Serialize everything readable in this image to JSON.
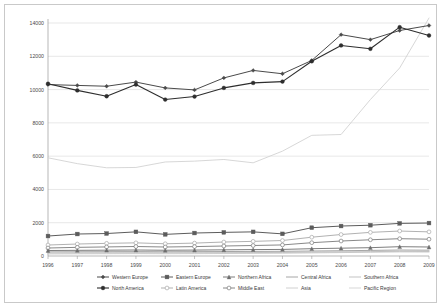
{
  "chart_data": {
    "type": "line",
    "title": "",
    "xlabel": "",
    "ylabel": "",
    "ylim": [
      0,
      14000
    ],
    "yticks": [
      0,
      2000,
      4000,
      6000,
      8000,
      10000,
      12000,
      14000
    ],
    "ytick_labels": [
      "0",
      "2000",
      "4000",
      "6000",
      "8000",
      "10000",
      "12000",
      "14000"
    ],
    "grid": true,
    "legend_position": "bottom",
    "categories": [
      "1996",
      "1997",
      "1998",
      "1999",
      "2000",
      "2001",
      "2002",
      "2003",
      "2004",
      "2005",
      "2006",
      "2007",
      "2008",
      "2009"
    ],
    "series": [
      {
        "name": "Western Europe",
        "color": "#4a4a4a",
        "marker": "diamond",
        "width": 1.0,
        "values": [
          10300,
          10250,
          10200,
          10450,
          10100,
          9980,
          10700,
          11150,
          10950,
          11750,
          13300,
          13000,
          13550,
          13850
        ]
      },
      {
        "name": "Eastern Europe",
        "color": "#5c5c5c",
        "marker": "square",
        "width": 1.0,
        "values": [
          1200,
          1320,
          1350,
          1450,
          1300,
          1380,
          1420,
          1450,
          1330,
          1700,
          1800,
          1850,
          1960,
          1980
        ]
      },
      {
        "name": "Northern Africa",
        "color": "#6e6e6e",
        "marker": "triangle",
        "width": 0.9,
        "values": [
          330,
          340,
          350,
          360,
          345,
          355,
          370,
          385,
          395,
          440,
          470,
          500,
          560,
          540
        ]
      },
      {
        "name": "Central Africa",
        "color": "#8f8f8f",
        "marker": "none",
        "width": 0.8,
        "values": [
          250,
          255,
          260,
          265,
          258,
          262,
          268,
          275,
          282,
          300,
          318,
          335,
          360,
          350
        ]
      },
      {
        "name": "Southern Africa",
        "color": "#b4b4b4",
        "marker": "none",
        "width": 0.8,
        "values": [
          180,
          185,
          190,
          196,
          190,
          194,
          200,
          208,
          214,
          232,
          248,
          262,
          285,
          275
        ]
      },
      {
        "name": "North America",
        "color": "#2e2e2e",
        "marker": "circle",
        "width": 1.1,
        "values": [
          10350,
          9950,
          9600,
          10300,
          9400,
          9580,
          10100,
          10400,
          10480,
          11700,
          12650,
          12450,
          13750,
          13250
        ]
      },
      {
        "name": "Latin America",
        "color": "#a8a8a8",
        "marker": "circle-open",
        "width": 0.9,
        "values": [
          660,
          720,
          760,
          790,
          735,
          775,
          840,
          880,
          930,
          1130,
          1290,
          1420,
          1500,
          1450
        ]
      },
      {
        "name": "Middle East",
        "color": "#7a7a7a",
        "marker": "circle-open",
        "width": 0.9,
        "values": [
          480,
          520,
          545,
          570,
          540,
          565,
          600,
          630,
          665,
          800,
          900,
          975,
          1040,
          1010
        ]
      },
      {
        "name": "Asia",
        "color": "#c4c4c4",
        "marker": "none",
        "width": 0.8,
        "values": [
          120,
          130,
          136,
          142,
          135,
          140,
          148,
          156,
          164,
          185,
          205,
          222,
          244,
          236
        ]
      },
      {
        "name": "Pacific Region",
        "color": "#d2d2d2",
        "marker": "none",
        "width": 0.9,
        "values": [
          5900,
          5550,
          5300,
          5320,
          5650,
          5700,
          5800,
          5600,
          6300,
          7250,
          7300,
          9400,
          11300,
          14300
        ]
      }
    ]
  },
  "legend": {
    "row1": [
      "Western Europe",
      "Eastern Europe",
      "Northern Africa",
      "Central Africa",
      "Southern Africa"
    ],
    "row2": [
      "North America",
      "Latin America",
      "Middle East",
      "Asia",
      "Pacific Region"
    ]
  }
}
